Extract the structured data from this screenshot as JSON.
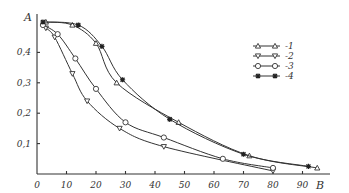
{
  "chart_data": {
    "type": "line",
    "title": "",
    "xlabel": "B",
    "ylabel": "A",
    "xlim": [
      0,
      98
    ],
    "ylim": [
      0,
      0.52
    ],
    "x_ticks": [
      0,
      10,
      20,
      30,
      40,
      50,
      60,
      70,
      80,
      90
    ],
    "x_tick_labels": [
      "0",
      "10",
      "20",
      "30",
      "40",
      "50",
      "60",
      "70",
      "80",
      "90"
    ],
    "y_ticks": [
      0.1,
      0.2,
      0.3,
      0.4
    ],
    "y_tick_labels": [
      "0,1",
      "0,2",
      "0,3",
      "0,4"
    ],
    "grid": false,
    "legend_position": "upper right",
    "series": [
      {
        "name": "1",
        "marker": "triangle-up",
        "x": [
          3,
          12,
          20,
          27,
          48,
          72,
          95
        ],
        "values": [
          0.5,
          0.49,
          0.43,
          0.3,
          0.17,
          0.06,
          0.02
        ]
      },
      {
        "name": "2",
        "marker": "triangle-down",
        "x": [
          3,
          6,
          12,
          17,
          28,
          43,
          80
        ],
        "values": [
          0.48,
          0.45,
          0.33,
          0.24,
          0.15,
          0.09,
          0.01
        ]
      },
      {
        "name": "3",
        "marker": "circle",
        "x": [
          2,
          7,
          13,
          20,
          30,
          43,
          63,
          80
        ],
        "values": [
          0.49,
          0.46,
          0.38,
          0.28,
          0.17,
          0.12,
          0.05,
          0.02
        ]
      },
      {
        "name": "4",
        "marker": "star",
        "x": [
          2,
          14,
          22,
          29,
          45,
          70,
          92
        ],
        "values": [
          0.5,
          0.49,
          0.42,
          0.31,
          0.18,
          0.065,
          0.025
        ]
      }
    ]
  },
  "legend": {
    "items": [
      "-1",
      "-2",
      "-3",
      "-4"
    ]
  },
  "axes": {
    "y_label": "A",
    "x_label": "B"
  }
}
